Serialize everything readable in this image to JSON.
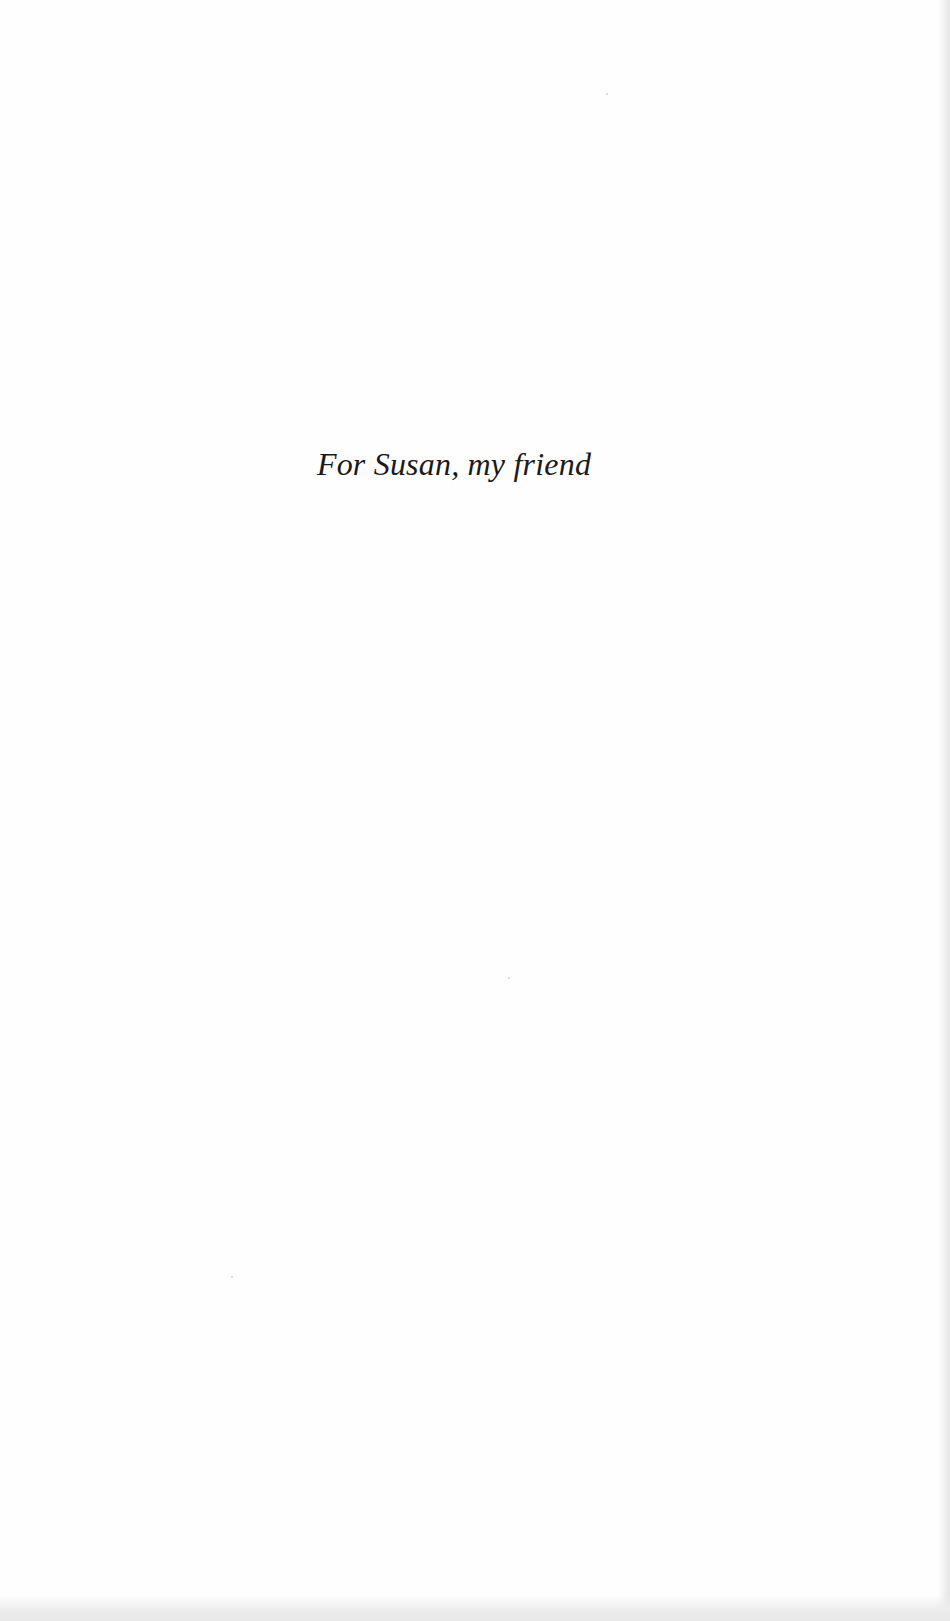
{
  "page": {
    "type": "dedication",
    "text": "For Susan, my friend"
  },
  "colors": {
    "background": "#fefefe",
    "text": "#1a1a1a",
    "scan_edge": "#e8e8e8"
  }
}
